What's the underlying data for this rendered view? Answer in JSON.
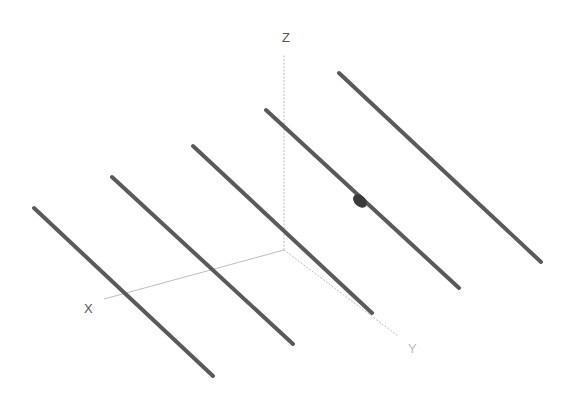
{
  "diagram": {
    "type": "3d-axes-with-parallel-lines",
    "background": "#ffffff",
    "axes": {
      "origin": [
        284,
        250
      ],
      "color": "#bdbdbd",
      "x": {
        "label": "X",
        "end": [
          104,
          299
        ],
        "label_pos": [
          84,
          313
        ],
        "label_color": "#555555"
      },
      "y": {
        "label": "Y",
        "end": [
          398,
          336
        ],
        "label_pos": [
          408,
          353
        ],
        "label_color": "#bbbbbb",
        "style": "dotted"
      },
      "z": {
        "label": "Z",
        "end": [
          284,
          55
        ],
        "label_pos": [
          282,
          42
        ],
        "label_color": "#555555",
        "style": "dotted"
      }
    },
    "lines": [
      {
        "id": "line-1",
        "from": [
          34,
          208
        ],
        "to": [
          213,
          376
        ]
      },
      {
        "id": "line-2",
        "from": [
          112,
          177
        ],
        "to": [
          293,
          344
        ]
      },
      {
        "id": "line-3",
        "from": [
          193,
          146
        ],
        "to": [
          372,
          313
        ]
      },
      {
        "id": "line-4",
        "from": [
          266,
          110
        ],
        "to": [
          459,
          288
        ]
      },
      {
        "id": "line-5",
        "from": [
          339,
          73
        ],
        "to": [
          541,
          262
        ]
      }
    ],
    "line_color": "#5a5a5a",
    "line_width": 4,
    "marker": {
      "on_line": "line-4",
      "center": [
        360,
        201
      ],
      "rx": 8,
      "ry": 5.5,
      "rotation": 42,
      "color": "#3a3a3a"
    }
  }
}
